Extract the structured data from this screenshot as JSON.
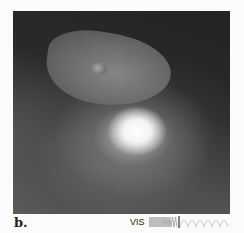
{
  "figure": {
    "panel_label": "b.",
    "spectrum": {
      "band_label": "VIS",
      "icon": "wavelength-spectrum-icon"
    },
    "photo": {
      "subject": "comet-nucleus-impact-flash",
      "colors": {
        "background": "#1a1a1a",
        "flash": "#ffffff",
        "nucleus": "#6e6e6e"
      }
    }
  }
}
